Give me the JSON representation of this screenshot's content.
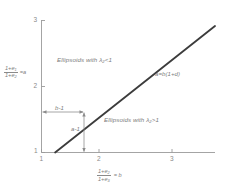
{
  "chart_data": {
    "type": "line",
    "title": "",
    "subtitle": "",
    "xlabel": "(1+e2)/(1+e3) = b",
    "ylabel": "(1+e1)/(1+e2) = a",
    "xlim": [
      1,
      3.55
    ],
    "ylim": [
      1,
      3.2
    ],
    "xticks": [
      "1",
      "2",
      "3"
    ],
    "xtick_values": [
      1,
      2,
      3
    ],
    "yticks": [
      "1",
      "2",
      "3"
    ],
    "ytick_values": [
      1,
      2,
      3
    ],
    "grid": false,
    "legend_position": "none",
    "series": [
      {
        "name": "a=b(1+d)",
        "type": "line",
        "x": [
          1.2,
          3.55
        ],
        "y": [
          1.0,
          3.1
        ],
        "color": "#3c3c3c",
        "label": "a=b(1+d)"
      }
    ],
    "annotations": [
      {
        "name": "region-upper",
        "text": "Ellipsoids  with   λ₂<1",
        "x": 1.35,
        "y": 2.6
      },
      {
        "name": "region-lower",
        "text": "Ellipsoids  with  λ₂>1",
        "x": 2.15,
        "y": 1.62
      },
      {
        "name": "line-equation",
        "text": "a=b(1+d)",
        "x": 2.55,
        "y": 2.35
      },
      {
        "name": "horizontal-span",
        "text": "b-1",
        "x": 1.35,
        "y": 1.52
      },
      {
        "name": "vertical-span",
        "text": "a-1",
        "x": 1.82,
        "y": 1.28
      }
    ]
  },
  "axes": {
    "x_label_parts": {
      "num": "1+e",
      "num_sub": "2",
      "den": "1+e",
      "den_sub": "3",
      "eq": "= b"
    },
    "y_label_parts": {
      "num": "1+e",
      "num_sub": "1",
      "den": "1+e",
      "den_sub": "2",
      "eq": "=a"
    },
    "x_tick_1": "1",
    "x_tick_2": "2",
    "x_tick_3": "3",
    "y_tick_1": "1",
    "y_tick_2": "2",
    "y_tick_3": "3"
  },
  "labels": {
    "region_upper": "Ellipsoids  with   λ₂<1",
    "region_lower": "Ellipsoids  with  λ₂>1",
    "line_equation": "a=b(1+d)",
    "span_horizontal": "b-1",
    "span_vertical": "a-1"
  },
  "colors": {
    "background": "#ffffff",
    "axis": "#9a9a9a",
    "line": "#3c3c3c",
    "text": "#7d7d7d",
    "annotation_arrow": "#8a8a8a"
  }
}
